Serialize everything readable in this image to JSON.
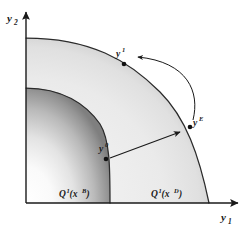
{
  "figure": {
    "background_color": "#ffffff",
    "stroke_color": "#1a1a1a"
  },
  "axes": {
    "y_axis": {
      "name": "vertical-axis",
      "label": "y",
      "subscript": "2",
      "label_x": 8,
      "label_y": 20
    },
    "x_axis": {
      "name": "horizontal-axis",
      "label": "y",
      "subscript": "1",
      "label_x": 223,
      "label_y": 219
    },
    "origin": {
      "x": 26,
      "y": 203
    },
    "x_end": {
      "x": 240,
      "y": 203
    },
    "y_end": {
      "x": 26,
      "y": 10
    }
  },
  "regions": [
    {
      "id": "inner-output-set",
      "label_base": "Q",
      "label_sup1": "1",
      "label_mid": "(x",
      "label_sup2": "B",
      "label_close": ")",
      "label_x": 60,
      "label_y": 196,
      "fill_start": "#fefefe",
      "fill_end": "#8c8c8c",
      "y_intercept": 88,
      "x_intercept": 110
    },
    {
      "id": "outer-output-set",
      "label_base": "Q",
      "label_sup1": "1",
      "label_mid": "(x",
      "label_sup2": "D",
      "label_close": ")",
      "label_x": 152,
      "label_y": 196,
      "fill_start": "#f1f1f1",
      "fill_end": "#d2d2d2",
      "y_intercept": 38,
      "x_intercept": 209
    }
  ],
  "points": [
    {
      "id": "point-y1",
      "label_base": "y",
      "label_sup": "1",
      "cx": 124,
      "cy": 63,
      "label_x": 117,
      "label_y": 55
    },
    {
      "id": "point-yE",
      "label_base": "y",
      "label_sup": "E",
      "cx": 190,
      "cy": 127,
      "label_x": 194,
      "label_y": 124
    },
    {
      "id": "point-y0",
      "label_base": "y",
      "label_sup": "0",
      "cx": 106,
      "cy": 158,
      "label_x": 100,
      "label_y": 150
    }
  ],
  "arrows": [
    {
      "id": "radial-expansion-arrow",
      "type": "straight",
      "from_x": 107,
      "from_y": 159,
      "to_x": 182,
      "to_y": 131
    },
    {
      "id": "allocative-movement-arrow",
      "type": "curved",
      "from_x": 192,
      "from_y": 121,
      "to_x": 140,
      "to_y": 58
    }
  ]
}
